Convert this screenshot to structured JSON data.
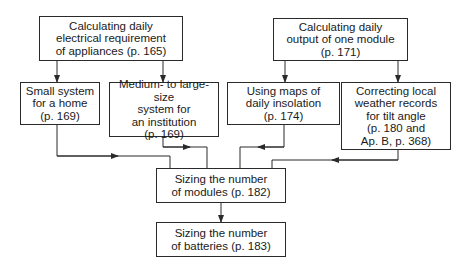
{
  "diagram": {
    "type": "flowchart",
    "nodes": {
      "daily_requirement": {
        "label": "Calculating daily\nelectrical requirement\nof appliances (p. 165)"
      },
      "daily_output": {
        "label": "Calculating daily\noutput of one module\n(p. 171)"
      },
      "small_system": {
        "label": "Small system\nfor a home\n(p. 169)"
      },
      "medium_system": {
        "label": "Medium- to large-size\nsystem for\nan institution\n(p. 169)"
      },
      "insolation_maps": {
        "label": "Using maps of\ndaily insolation\n(p. 174)"
      },
      "weather_records": {
        "label": "Correcting local\nweather records\nfor tilt angle\n(p. 180 and\nAp. B, p. 368)"
      },
      "sizing_modules": {
        "label": "Sizing the number\nof modules (p. 182)"
      },
      "sizing_batteries": {
        "label": "Sizing the number\nof batteries (p. 183)"
      }
    },
    "edges": [
      [
        "daily_requirement",
        "small_system"
      ],
      [
        "daily_requirement",
        "medium_system"
      ],
      [
        "daily_output",
        "insolation_maps"
      ],
      [
        "daily_output",
        "weather_records"
      ],
      [
        "small_system",
        "sizing_modules"
      ],
      [
        "medium_system",
        "sizing_modules"
      ],
      [
        "insolation_maps",
        "sizing_modules"
      ],
      [
        "weather_records",
        "sizing_modules"
      ],
      [
        "sizing_modules",
        "sizing_batteries"
      ]
    ],
    "colors": {
      "line": "#2a2a2a",
      "background": "#ffffff"
    }
  }
}
